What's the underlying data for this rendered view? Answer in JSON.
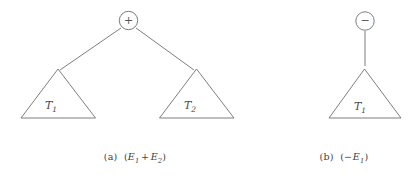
{
  "figure": {
    "background_color": "#ffffff",
    "stroke_color": "#6f6f6f",
    "text_color": "#3f3f3f"
  },
  "panels": [
    {
      "id": "a",
      "root_node": {
        "shape": "circle",
        "symbol": "+",
        "icon_name": "plus-operator-node"
      },
      "children": [
        {
          "shape": "triangle",
          "label_base": "T",
          "label_sub": "1"
        },
        {
          "shape": "triangle",
          "label_base": "T",
          "label_sub": "2"
        }
      ],
      "caption": {
        "index": "(a)",
        "open_paren": "(",
        "left_operand_base": "E",
        "left_operand_sub": "1",
        "operator": "+",
        "right_operand_base": "E",
        "right_operand_sub": "2",
        "close_paren": ")",
        "full_text": "(a) (E1 + E2)"
      }
    },
    {
      "id": "b",
      "root_node": {
        "shape": "circle",
        "symbol": "−",
        "icon_name": "minus-operator-node"
      },
      "children": [
        {
          "shape": "triangle",
          "label_base": "T",
          "label_sub": "1"
        }
      ],
      "caption": {
        "index": "(b)",
        "open_paren": "(",
        "operator": "−",
        "right_operand_base": "E",
        "right_operand_sub": "1",
        "close_paren": ")",
        "full_text": "(b) (-E1)"
      }
    }
  ]
}
